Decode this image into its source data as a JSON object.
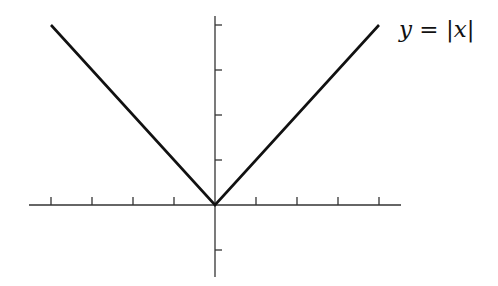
{
  "chart_data": {
    "type": "line",
    "title": "",
    "xlabel": "",
    "ylabel": "",
    "series": [
      {
        "name": "y = |x|",
        "x": [
          -4,
          0,
          4
        ],
        "y": [
          4,
          0,
          4
        ]
      }
    ],
    "x_ticks": [
      -4,
      -3,
      -2,
      -1,
      1,
      2,
      3,
      4
    ],
    "y_ticks": [
      -1,
      1,
      2,
      3,
      4
    ],
    "tick_labels_shown": false,
    "xlim": [
      -4.5,
      4.5
    ],
    "ylim": [
      -1.6,
      4.2
    ],
    "grid": false,
    "legend": "none",
    "annotations": [
      {
        "text": "y = |x|",
        "position": "upper-right, at end of right branch"
      }
    ]
  },
  "label": {
    "y": "y",
    "eq": " = ",
    "bar_open": "|",
    "x": "x",
    "bar_close": "|"
  },
  "colors": {
    "curve": "#111111",
    "axes": "#333333",
    "background": "#ffffff"
  }
}
